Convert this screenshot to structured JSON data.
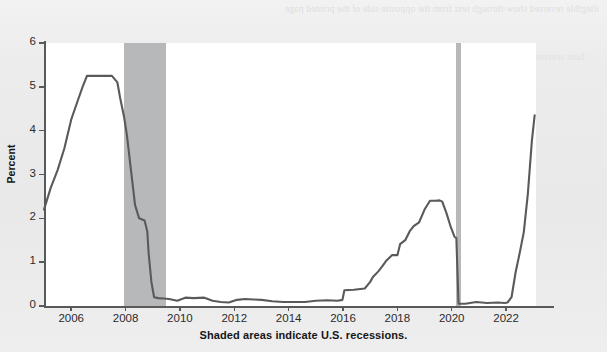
{
  "figure": {
    "y_axis_title": "Percent",
    "caption": "Shaded areas indicate U.S. recessions.",
    "y_ticks": [
      "0",
      "1",
      "2",
      "3",
      "4",
      "5",
      "6"
    ],
    "x_ticks": [
      "2006",
      "2008",
      "2010",
      "2012",
      "2014",
      "2016",
      "2018",
      "2020",
      "2022"
    ],
    "line_color": "#5a5a5c",
    "recession_color": "#b7b8ba",
    "plot_background": "#ffffff",
    "page_background": "#ececed"
  },
  "artifact": {
    "showthrough_top": "illegible reversed show-through text from the opposite side of the printed page",
    "showthrough_mid": "faint reversed paragraph text visible behind the chart"
  },
  "chart_data": {
    "type": "line",
    "title": "",
    "xlabel": "",
    "ylabel": "Percent",
    "xlim": [
      2005.0,
      2023.1
    ],
    "ylim": [
      0,
      6
    ],
    "yticks": [
      0,
      1,
      2,
      3,
      4,
      5,
      6
    ],
    "xticks": [
      2006,
      2008,
      2010,
      2012,
      2014,
      2016,
      2018,
      2020,
      2022
    ],
    "grid": false,
    "legend": "none",
    "annotations": [
      "Shaded areas indicate U.S. recessions."
    ],
    "shaded_regions": [
      {
        "label": "U.S. recession",
        "x_start": 2007.95,
        "x_end": 2009.5
      },
      {
        "label": "U.S. recession",
        "x_start": 2020.15,
        "x_end": 2020.35
      }
    ],
    "series": [
      {
        "name": "Federal Funds Effective Rate",
        "x": [
          2005.0,
          2005.25,
          2005.5,
          2005.75,
          2006.0,
          2006.25,
          2006.42,
          2006.58,
          2006.75,
          2007.0,
          2007.25,
          2007.5,
          2007.7,
          2007.8,
          2007.95,
          2008.05,
          2008.2,
          2008.35,
          2008.5,
          2008.7,
          2008.8,
          2008.85,
          2008.95,
          2009.05,
          2009.2,
          2009.4,
          2009.6,
          2009.9,
          2010.2,
          2010.5,
          2010.9,
          2011.2,
          2011.5,
          2011.8,
          2012.1,
          2012.4,
          2012.7,
          2013.0,
          2013.4,
          2013.8,
          2014.2,
          2014.6,
          2015.0,
          2015.4,
          2015.8,
          2015.98,
          2016.05,
          2016.4,
          2016.8,
          2017.0,
          2017.1,
          2017.3,
          2017.45,
          2017.6,
          2017.8,
          2018.0,
          2018.1,
          2018.3,
          2018.45,
          2018.6,
          2018.8,
          2019.0,
          2019.2,
          2019.4,
          2019.55,
          2019.65,
          2019.8,
          2019.95,
          2020.1,
          2020.17,
          2020.25,
          2020.5,
          2020.9,
          2021.3,
          2021.7,
          2021.95,
          2022.05,
          2022.2,
          2022.35,
          2022.5,
          2022.65,
          2022.8,
          2022.95,
          2023.05
        ],
        "y": [
          2.2,
          2.7,
          3.1,
          3.6,
          4.25,
          4.7,
          5.0,
          5.25,
          5.25,
          5.25,
          5.25,
          5.25,
          5.1,
          4.75,
          4.3,
          3.9,
          3.1,
          2.3,
          2.0,
          1.95,
          1.7,
          1.2,
          0.55,
          0.2,
          0.18,
          0.17,
          0.16,
          0.12,
          0.19,
          0.18,
          0.19,
          0.12,
          0.09,
          0.08,
          0.14,
          0.16,
          0.15,
          0.14,
          0.11,
          0.09,
          0.09,
          0.09,
          0.12,
          0.13,
          0.12,
          0.14,
          0.36,
          0.37,
          0.4,
          0.55,
          0.66,
          0.79,
          0.91,
          1.04,
          1.16,
          1.16,
          1.41,
          1.51,
          1.7,
          1.82,
          1.91,
          2.2,
          2.4,
          2.4,
          2.41,
          2.38,
          2.13,
          1.83,
          1.58,
          1.55,
          0.05,
          0.05,
          0.09,
          0.07,
          0.08,
          0.07,
          0.08,
          0.2,
          0.77,
          1.21,
          1.68,
          2.56,
          3.78,
          4.35
        ]
      }
    ]
  }
}
